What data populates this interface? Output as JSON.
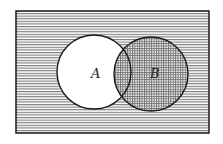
{
  "diagram": {
    "type": "venn",
    "universe": {
      "x": 16,
      "y": 11,
      "width": 193,
      "height": 122,
      "fill": "horizontal-lines"
    },
    "sets": [
      {
        "label": "A",
        "cx": 94,
        "cy": 72,
        "r": 37,
        "fill": "white"
      },
      {
        "label": "B",
        "cx": 151,
        "cy": 74,
        "r": 37,
        "fill": "crosshatch"
      }
    ],
    "shaded_regions": [
      "complement of A",
      "B"
    ],
    "colors": {
      "stroke": "#1a1a1a",
      "hatch": "#6a6a6a",
      "background": "#ffffff"
    }
  }
}
